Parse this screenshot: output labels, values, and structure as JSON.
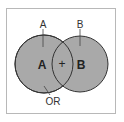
{
  "diagram": {
    "type": "venn",
    "top_labels": {
      "a": "A",
      "b": "B"
    },
    "inner_labels": {
      "a": "A",
      "intersection": "+",
      "b": "B"
    },
    "bottom_label": "OR",
    "colors": {
      "fill": "#a9a9a9",
      "stroke": "#333333",
      "frame": "#b8b8b8",
      "text": "#222222"
    }
  }
}
